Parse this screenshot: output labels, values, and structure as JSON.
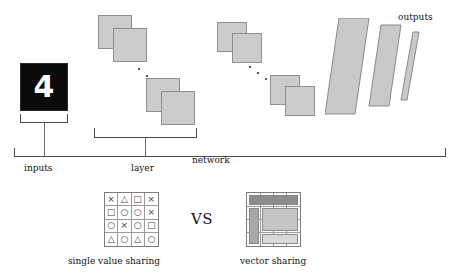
{
  "figure": {
    "title_labels": {
      "inputs": "inputs",
      "layer": "layer",
      "network": "network",
      "outputs": "outputs"
    },
    "input_image": {
      "digit": "4",
      "background_color": "#0a0a0a",
      "foreground_color": "#fdfdfd"
    },
    "comparison": {
      "vs_label": "VS",
      "left": {
        "caption": "single value sharing",
        "rows": [
          [
            "×",
            "△",
            "□",
            "×"
          ],
          [
            "□",
            "○",
            "○",
            "×"
          ],
          [
            "○",
            "×",
            "○",
            "□"
          ],
          [
            "△",
            "○",
            "△",
            "○"
          ]
        ]
      },
      "right": {
        "caption": "vector sharing",
        "band_colors": [
          "#8c8c8c",
          "#a8a8a8",
          "#c6c6c6",
          "#d8d8d8"
        ]
      }
    },
    "colors": {
      "feature_map_fill": "#cccccc",
      "feature_map_stroke": "#8f8f8f",
      "output_fill": "#c9c9c9",
      "output_stroke": "#8a8a8a",
      "bracket_stroke": "#4a4a4a",
      "text": "#141414"
    },
    "feature_maps": [
      {
        "x": 98,
        "y": 15,
        "size": 34
      },
      {
        "x": 113,
        "y": 28,
        "size": 34
      },
      {
        "x": 146,
        "y": 78,
        "size": 34
      },
      {
        "x": 161,
        "y": 91,
        "size": 34
      },
      {
        "x": 217,
        "y": 22,
        "size": 30
      },
      {
        "x": 232,
        "y": 33,
        "size": 30
      },
      {
        "x": 270,
        "y": 75,
        "size": 30
      },
      {
        "x": 285,
        "y": 86,
        "size": 30
      }
    ],
    "dot_groups": [
      [
        {
          "x": 138,
          "y": 68
        },
        {
          "x": 146,
          "y": 75
        },
        {
          "x": 154,
          "y": 82
        }
      ],
      [
        {
          "x": 249,
          "y": 66
        },
        {
          "x": 257,
          "y": 72
        },
        {
          "x": 265,
          "y": 78
        }
      ]
    ],
    "outputs_shapes": [
      {
        "top_x": 337,
        "width": 30,
        "height": 100,
        "skew": 28
      },
      {
        "top_x": 376,
        "width": 20,
        "height": 85,
        "skew": 24
      },
      {
        "top_x": 405,
        "width": 6,
        "height": 72,
        "skew": 21
      }
    ]
  }
}
